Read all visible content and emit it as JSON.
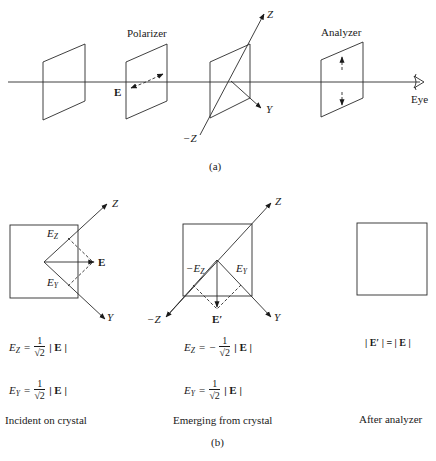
{
  "figure": {
    "part_a": {
      "caption": "(a)",
      "labels": {
        "polarizer": "Polarizer",
        "analyzer": "Analyzer",
        "eye": "Eye",
        "field": "E",
        "axis_z": "Z",
        "axis_neg_z": "−Z",
        "axis_y": "Y"
      },
      "icons": [
        "eye-icon"
      ]
    },
    "part_b": {
      "caption": "(b)",
      "panels": [
        {
          "title": "Incident on crystal",
          "labels": {
            "ez": "E",
            "ez_sub": "Z",
            "ey": "E",
            "ey_sub": "Y",
            "field": "E",
            "axis_z": "Z",
            "axis_y": "Y"
          },
          "equations": [
            {
              "lhs": "E",
              "lhs_sub": "Z",
              "eq": "=",
              "sign": "",
              "num": "1",
              "den": "√2",
              "rhs": "| E |"
            },
            {
              "lhs": "E",
              "lhs_sub": "Y",
              "eq": "=",
              "sign": "",
              "num": "1",
              "den": "√2",
              "rhs": "| E |"
            }
          ]
        },
        {
          "title": "Emerging from crystal",
          "labels": {
            "ez": "−E",
            "ez_sub": "Z",
            "ey": "E",
            "ey_sub": "Y",
            "field": "E′",
            "axis_z": "Z",
            "axis_neg_z": "−Z",
            "axis_y": "Y"
          },
          "equations": [
            {
              "lhs": "E",
              "lhs_sub": "Z",
              "eq": "=",
              "sign": "−",
              "num": "1",
              "den": "√2",
              "rhs": "| E |"
            },
            {
              "lhs": "E",
              "lhs_sub": "Y",
              "eq": "=",
              "sign": "",
              "num": "1",
              "den": "√2",
              "rhs": "| E |"
            }
          ]
        },
        {
          "title": "After analyzer",
          "equations": [
            {
              "text": "| E′ | = | E |"
            }
          ]
        }
      ]
    }
  }
}
